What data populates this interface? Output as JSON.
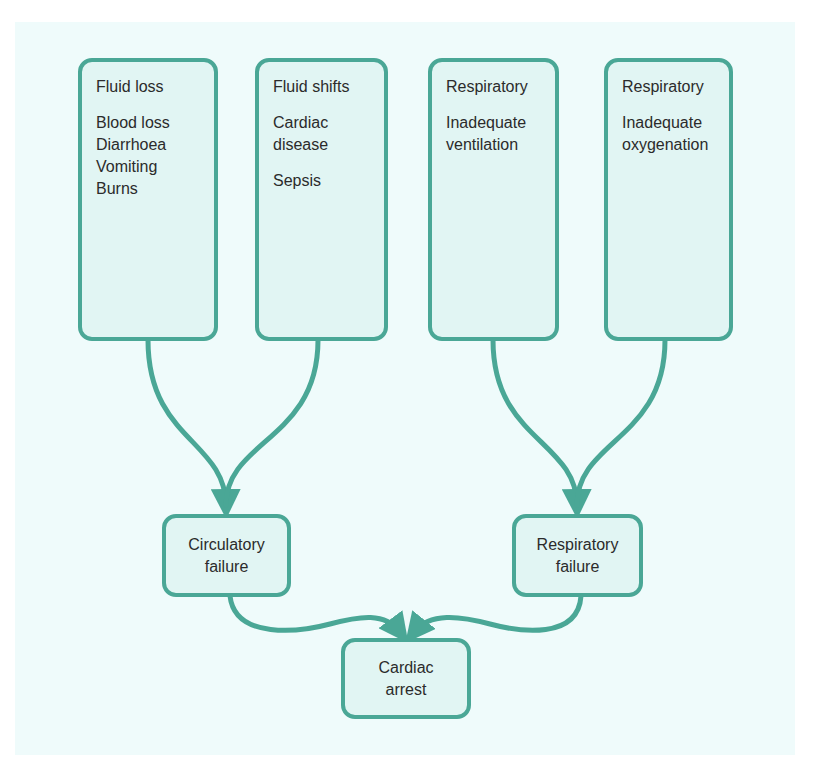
{
  "diagram": {
    "colors": {
      "panel_bg": "#effbfb",
      "box_fill": "#e1f5f3",
      "accent": "#4aa796",
      "text": "#2b2b2b"
    },
    "causes": [
      {
        "title": "Fluid loss",
        "groups": [
          [
            "Blood loss",
            "Diarrhoea",
            "Vomiting",
            "Burns"
          ]
        ]
      },
      {
        "title": "Fluid shifts",
        "groups": [
          [
            "Cardiac",
            "disease"
          ],
          [
            "Sepsis"
          ]
        ]
      },
      {
        "title": "Respiratory",
        "groups": [
          [
            "Inadequate",
            "ventilation"
          ]
        ]
      },
      {
        "title": "Respiratory",
        "groups": [
          [
            "Inadequate",
            "oxygenation"
          ]
        ]
      }
    ],
    "intermediate": [
      {
        "lines": [
          "Circulatory",
          "failure"
        ]
      },
      {
        "lines": [
          "Respiratory",
          "failure"
        ]
      }
    ],
    "outcome": {
      "lines": [
        "Cardiac",
        "arrest"
      ]
    },
    "edges": [
      {
        "from": "Fluid loss",
        "to": "Circulatory failure"
      },
      {
        "from": "Fluid shifts",
        "to": "Circulatory failure"
      },
      {
        "from": "Respiratory: Inadequate ventilation",
        "to": "Respiratory failure"
      },
      {
        "from": "Respiratory: Inadequate oxygenation",
        "to": "Respiratory failure"
      },
      {
        "from": "Circulatory failure",
        "to": "Cardiac arrest"
      },
      {
        "from": "Respiratory failure",
        "to": "Cardiac arrest"
      }
    ]
  }
}
